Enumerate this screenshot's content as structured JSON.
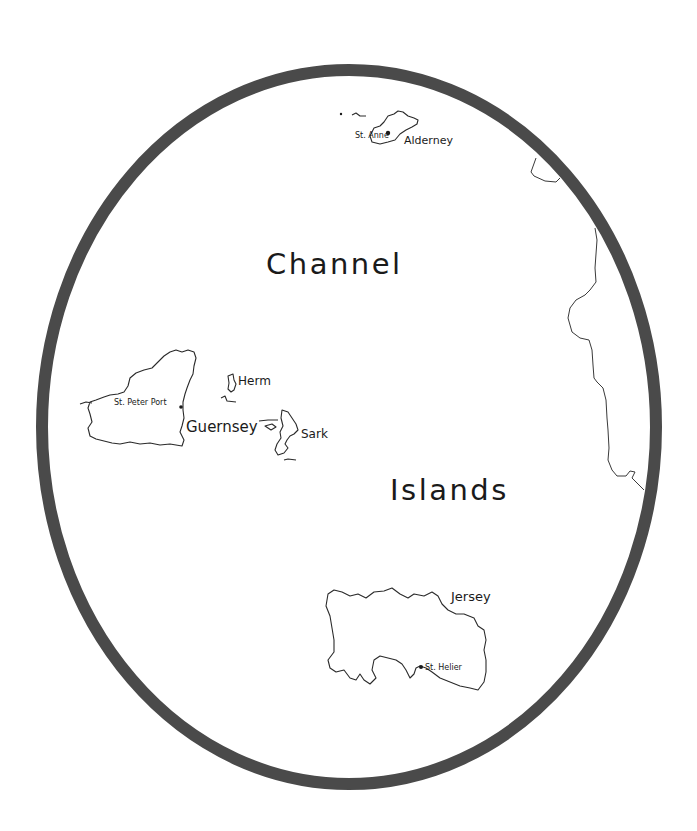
{
  "map": {
    "title_line1": "Channel",
    "title_line2": "Islands",
    "frame_color": "#4a4a4a",
    "islands": [
      {
        "name": "Alderney",
        "town": "St. Anne"
      },
      {
        "name": "Guernsey",
        "town": "St. Peter Port"
      },
      {
        "name": "Herm"
      },
      {
        "name": "Sark"
      },
      {
        "name": "Jersey",
        "town": "St. Helier"
      }
    ]
  }
}
